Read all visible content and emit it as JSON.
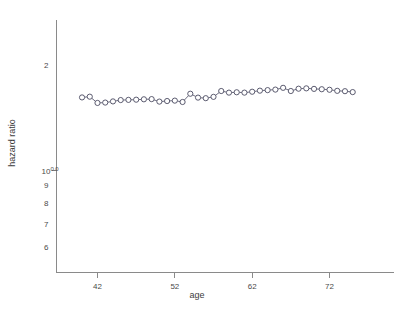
{
  "chart_data": {
    "type": "line",
    "title": "",
    "xlabel": "age",
    "ylabel": "hazard ratio",
    "xlim": [
      38.5,
      76.5
    ],
    "ylim": [
      0.55,
      2.35
    ],
    "yscale": "log",
    "grid": false,
    "legend": null,
    "marker": "open-circle",
    "x_ticks": [
      42,
      52,
      62,
      72
    ],
    "x_tick_labels": [
      "42",
      "52",
      "62",
      "72"
    ],
    "y_ticks": [
      2.0,
      1.0,
      0.9,
      0.8,
      0.7,
      0.6
    ],
    "y_tick_labels": [
      "2",
      "10^0.0",
      "9",
      "8",
      "7",
      "6"
    ],
    "y_tick_label_base": "10",
    "y_tick_label_exponent": "0.0",
    "series": [
      {
        "name": "hazard ratio",
        "x": [
          40.0,
          41.0,
          42.0,
          43.0,
          44.0,
          45.0,
          46.0,
          47.0,
          48.0,
          49.0,
          50.0,
          51.0,
          52.0,
          53.0,
          54.0,
          55.0,
          56.0,
          57.0,
          58.0,
          59.0,
          60.0,
          61.0,
          62.0,
          63.0,
          64.0,
          65.0,
          66.0,
          67.0,
          68.0,
          69.0,
          70.0,
          71.0,
          72.0,
          73.0,
          74.0,
          75.0
        ],
        "y": [
          1.62,
          1.628,
          1.562,
          1.566,
          1.578,
          1.592,
          1.594,
          1.596,
          1.6,
          1.602,
          1.576,
          1.582,
          1.586,
          1.572,
          1.66,
          1.618,
          1.612,
          1.626,
          1.69,
          1.672,
          1.676,
          1.672,
          1.682,
          1.694,
          1.7,
          1.706,
          1.726,
          1.69,
          1.716,
          1.72,
          1.714,
          1.71,
          1.704,
          1.692,
          1.688,
          1.678
        ]
      }
    ]
  },
  "axes": {
    "x_axis_name": "age-axis",
    "y_axis_name": "hazard-ratio-axis"
  }
}
